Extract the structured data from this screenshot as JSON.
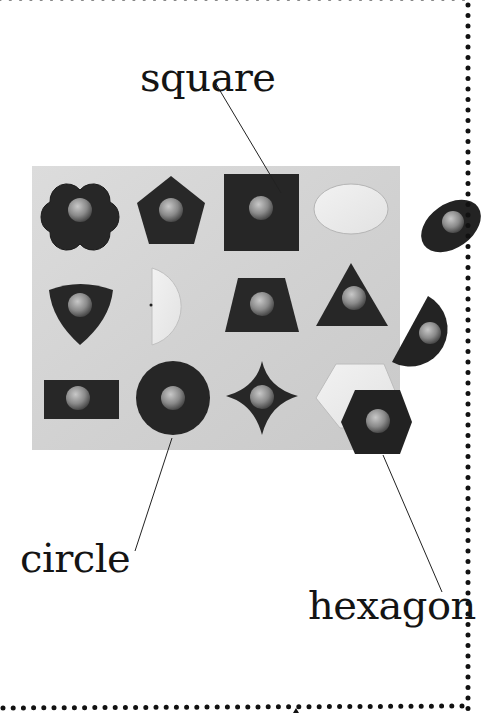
{
  "page": {
    "background": "#ffffff",
    "border_dot_color": "#111111"
  },
  "labels": {
    "square": "square",
    "circle": "circle",
    "hexagon": "hexagon"
  },
  "board": {
    "color": "#d9d9d9",
    "piece_color": "#262626",
    "knob_color": "#8c8c8c",
    "rows": [
      [
        "quatrefoil",
        "pentagon",
        "square",
        "ellipse (empty)"
      ],
      [
        "curved triangle",
        "semicircle (empty)",
        "trapezoid",
        "triangle"
      ],
      [
        "rectangle",
        "circle",
        "curved star",
        "hexagon (empty)"
      ]
    ],
    "loose_pieces": [
      "ellipse",
      "semicircle",
      "hexagon"
    ]
  }
}
